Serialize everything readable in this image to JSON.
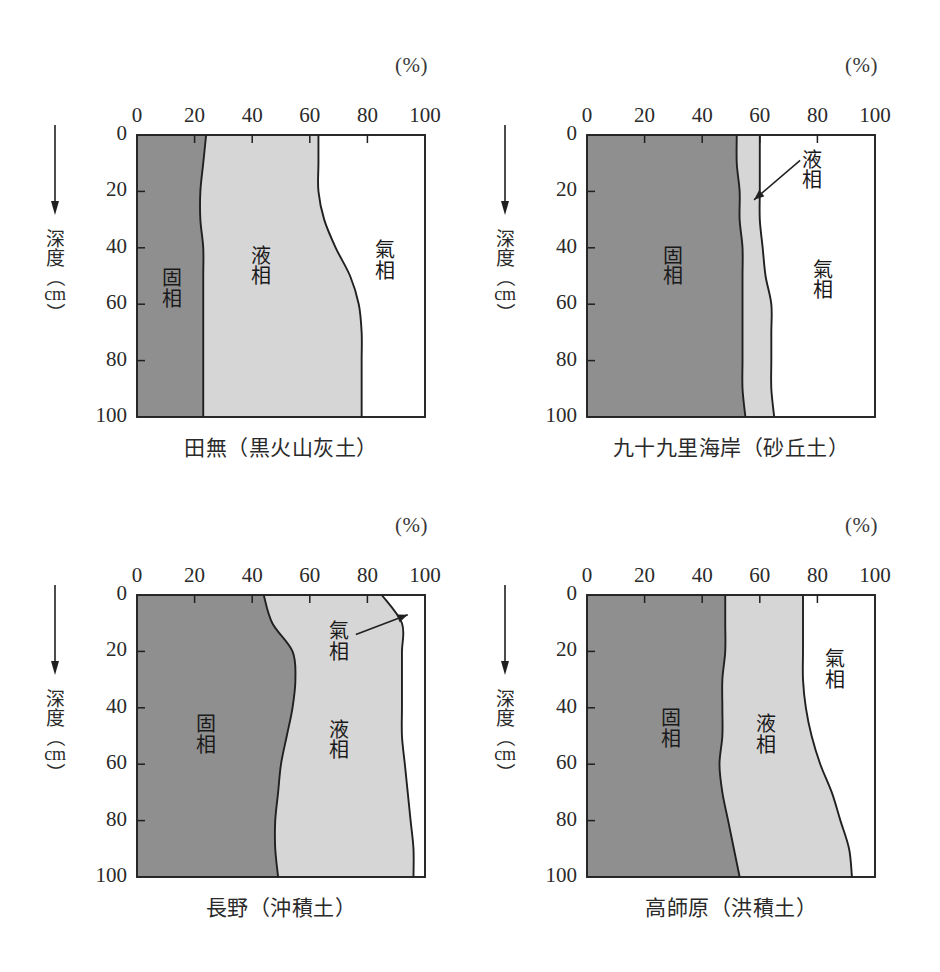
{
  "figure": {
    "unit_label": "(%)",
    "y_axis": {
      "title_chars": [
        "深",
        "度"
      ],
      "paren_open": "（",
      "unit": "cm",
      "paren_close": "）",
      "direction_icon": "down-arrow-icon"
    },
    "axis": {
      "x_ticks": [
        "0",
        "20",
        "40",
        "60",
        "80",
        "100"
      ],
      "y_ticks": [
        "0",
        "20",
        "40",
        "60",
        "80",
        "100"
      ],
      "x_min": 0,
      "x_max": 100,
      "y_min": 0,
      "y_max": 100
    },
    "phase_names": {
      "solid": "固相",
      "liquid": "液相",
      "gas": "氣相"
    },
    "colors": {
      "solid_fill": "#8f8f8f",
      "liquid_fill": "#d6d6d6",
      "gas_fill": "#ffffff",
      "line": "#202020",
      "page_background": "#ffffff",
      "text": "#1f1f1f"
    }
  },
  "chart_data": [
    {
      "type": "area",
      "id": "tanashi",
      "title": "田無（黒火山灰土）",
      "xlabel": "(%)",
      "ylabel": "深度（cm）",
      "xlim": [
        0,
        100
      ],
      "ylim": [
        0,
        100
      ],
      "y_inverted": true,
      "grid": false,
      "legend": "in-plot-labels",
      "depths": [
        0,
        10,
        20,
        30,
        40,
        50,
        60,
        70,
        80,
        90,
        100
      ],
      "series": [
        {
          "name": "固相",
          "boundary_values": [
            24,
            23,
            22,
            22,
            23,
            23,
            23,
            23,
            23,
            23,
            23
          ]
        },
        {
          "name": "液相",
          "boundary_values": [
            63,
            63,
            63,
            65,
            69,
            74,
            77,
            78,
            78,
            78,
            78
          ]
        },
        {
          "name": "氣相",
          "boundary_values": [
            100,
            100,
            100,
            100,
            100,
            100,
            100,
            100,
            100,
            100,
            100
          ]
        }
      ],
      "label_positions": {
        "solid": {
          "x": 12,
          "y": 55
        },
        "liquid": {
          "x": 43,
          "y": 47
        },
        "gas": {
          "x": 86,
          "y": 45
        }
      },
      "annotation_arrow": null
    },
    {
      "type": "area",
      "id": "kujukuri",
      "title": "九十九里海岸（砂丘土）",
      "xlabel": "(%)",
      "ylabel": "深度（cm）",
      "xlim": [
        0,
        100
      ],
      "ylim": [
        0,
        100
      ],
      "y_inverted": true,
      "grid": false,
      "legend": "in-plot-labels",
      "depths": [
        0,
        10,
        20,
        30,
        40,
        50,
        60,
        70,
        80,
        90,
        100
      ],
      "series": [
        {
          "name": "固相",
          "boundary_values": [
            52,
            52,
            53,
            53,
            54,
            54,
            54,
            54,
            54,
            54,
            55
          ]
        },
        {
          "name": "液相",
          "boundary_values": [
            60,
            60,
            60,
            60,
            61,
            62,
            64,
            64,
            64,
            64,
            65
          ]
        },
        {
          "name": "氣相",
          "boundary_values": [
            100,
            100,
            100,
            100,
            100,
            100,
            100,
            100,
            100,
            100,
            100
          ]
        }
      ],
      "label_positions": {
        "solid": {
          "x": 30,
          "y": 47
        },
        "liquid": {
          "x": 78,
          "y": 13
        },
        "gas": {
          "x": 82,
          "y": 52
        }
      },
      "annotation_arrow": {
        "label": "液相",
        "from_x": 74,
        "from_y": 9,
        "to_x": 58,
        "to_y": 23
      }
    },
    {
      "type": "area",
      "id": "nagano",
      "title": "長野（沖積土）",
      "xlabel": "(%)",
      "ylabel": "深度（cm）",
      "xlim": [
        0,
        100
      ],
      "ylim": [
        0,
        100
      ],
      "y_inverted": true,
      "grid": false,
      "legend": "in-plot-labels",
      "depths": [
        0,
        10,
        20,
        30,
        40,
        50,
        60,
        70,
        80,
        90,
        100
      ],
      "series": [
        {
          "name": "固相",
          "boundary_values": [
            44,
            47,
            54,
            55,
            54,
            52,
            50,
            49,
            48,
            48,
            49
          ]
        },
        {
          "name": "液相",
          "boundary_values": [
            85,
            92,
            92,
            92,
            92,
            92,
            93,
            94,
            95,
            96,
            96
          ]
        },
        {
          "name": "氣相",
          "boundary_values": [
            100,
            100,
            100,
            100,
            100,
            100,
            100,
            100,
            100,
            100,
            100
          ]
        }
      ],
      "label_positions": {
        "solid": {
          "x": 24,
          "y": 50
        },
        "liquid": {
          "x": 70,
          "y": 52
        },
        "gas": {
          "x": 70,
          "y": 17
        }
      },
      "annotation_arrow": {
        "label": "氣相",
        "from_x": 76,
        "from_y": 14,
        "to_x": 94,
        "to_y": 7
      }
    },
    {
      "type": "area",
      "id": "takashihara",
      "title": "高師原（洪積土）",
      "xlabel": "(%)",
      "ylabel": "深度（cm）",
      "xlim": [
        0,
        100
      ],
      "ylim": [
        0,
        100
      ],
      "y_inverted": true,
      "grid": false,
      "legend": "in-plot-labels",
      "depths": [
        0,
        10,
        20,
        30,
        40,
        50,
        60,
        70,
        80,
        90,
        100
      ],
      "series": [
        {
          "name": "固相",
          "boundary_values": [
            48,
            48,
            48,
            47,
            47,
            47,
            46,
            47,
            49,
            51,
            53
          ]
        },
        {
          "name": "液相",
          "boundary_values": [
            75,
            75,
            75,
            75,
            76,
            78,
            81,
            85,
            88,
            91,
            92
          ]
        },
        {
          "name": "氣相",
          "boundary_values": [
            100,
            100,
            100,
            100,
            100,
            100,
            100,
            100,
            100,
            100,
            100
          ]
        }
      ],
      "label_positions": {
        "solid": {
          "x": 29,
          "y": 48
        },
        "liquid": {
          "x": 62,
          "y": 50
        },
        "gas": {
          "x": 86,
          "y": 27
        }
      },
      "annotation_arrow": null
    }
  ]
}
